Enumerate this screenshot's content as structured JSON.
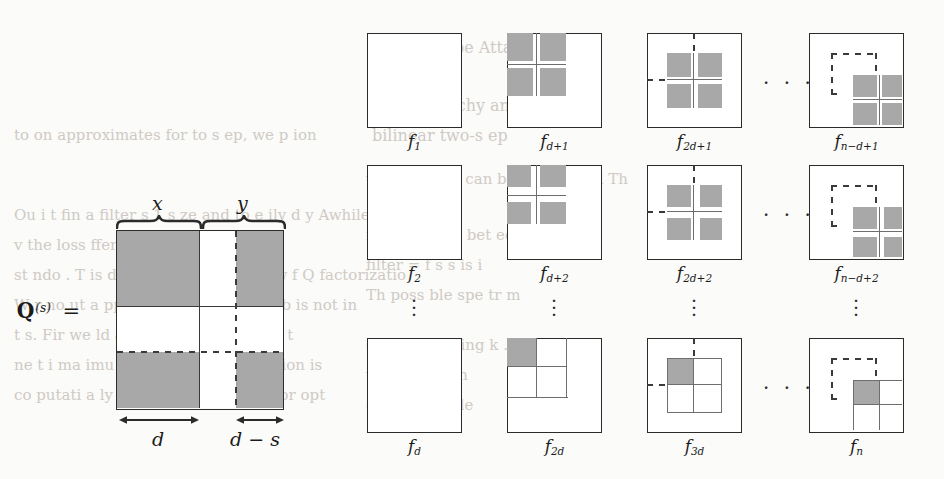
{
  "figure": {
    "kind": "mathematical-diagram",
    "left_panel": {
      "equation_label": "Q",
      "equation_superscript": "(s)",
      "equals": "=",
      "top_braces": [
        {
          "label": "x"
        },
        {
          "label": "y"
        }
      ],
      "bottom_measures": [
        {
          "label": "d"
        },
        {
          "label": "d − s"
        }
      ]
    },
    "grid_panel": {
      "ellipsis_horizontal": "· · ·",
      "ellipsis_vertical": "⋮",
      "rows": [
        {
          "cells": [
            {
              "caption_base": "f",
              "caption_sub": "1"
            },
            {
              "caption_base": "f",
              "caption_sub": "d+1"
            },
            {
              "caption_base": "f",
              "caption_sub": "2d+1"
            },
            {
              "caption_base": "f",
              "caption_sub": "n−d+1"
            }
          ]
        },
        {
          "cells": [
            {
              "caption_base": "f",
              "caption_sub": "2"
            },
            {
              "caption_base": "f",
              "caption_sub": "d+2"
            },
            {
              "caption_base": "f",
              "caption_sub": "2d+2"
            },
            {
              "caption_base": "f",
              "caption_sub": "n−d+2"
            }
          ]
        },
        {
          "cells": [
            {
              "caption_base": "f",
              "caption_sub": "d"
            },
            {
              "caption_base": "f",
              "caption_sub": "2d"
            },
            {
              "caption_base": "f",
              "caption_sub": "3d"
            },
            {
              "caption_base": "f",
              "caption_sub": "n"
            }
          ]
        }
      ]
    },
    "colors": {
      "shade_gray": "#a8a8a8",
      "line_dark": "#2b2b2b",
      "line_mid": "#6e6e6e",
      "paper": "#fbfbfa",
      "ghost_text": "#cfcac4"
    },
    "background_ghost_text": [
      "3.  ipt u  s be  Attac",
      "the Hierarchy and the",
      "bilinear two-s ep",
      "to on  approximates for  to s ep, we  p ion",
      "Ou  i  t fin  a filter  s 1 s ze  and to  e ily d y  Awhile  e",
      "v          the loss  fferen    ra   ge      l hen    t  o",
      "st   ndo .  T    is done by finding k   d row  f   Q   factorizatio",
      "W  r  no   ut  a   ppro    that  stra  hi forwa  b  is not in",
      "t  s.  Fir    we  ld    a  st  in    rom  the z   and   t  t",
      "ne  t   i   ma  imu   if l  f  be  ummab.  T    e  i  ion is",
      "co  putati   a  ly exp   v   ov   all  i a    op   m   for    opt",
      "v rsi n  th   jus  can be  d      ur  e  g    q          l     Th",
      "is in i   to  S   to   bet ee",
      "   filter  =  f    s   s   is   i",
      "  Th  poss ble  spe tr  m",
      "  done  be  finding  k  . d",
      "  v   kn  wn  f  r  th",
      "  ctor  i  s  s  mple",
      "    se   of  all  abl",
      "  exp n   v  ov   all"
    ]
  }
}
